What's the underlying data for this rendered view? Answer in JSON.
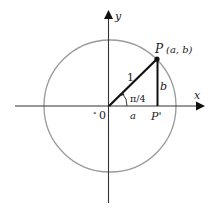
{
  "diagram": {
    "type": "unit-circle",
    "axes": {
      "x_label": "x",
      "y_label": "y",
      "origin_label": "0",
      "origin_mark": "°"
    },
    "circle": {
      "radius_label": "1",
      "stroke_color": "#9a9a9a"
    },
    "point": {
      "name": "P",
      "coords": "(a, b)"
    },
    "projection": {
      "name": "P'"
    },
    "angle_label": "π/4",
    "segment_labels": {
      "adjacent": "a",
      "opposite": "b",
      "hypotenuse": "1"
    },
    "colors": {
      "axis": "#333333",
      "triangle": "#111111",
      "circle": "#9a9a9a"
    }
  }
}
